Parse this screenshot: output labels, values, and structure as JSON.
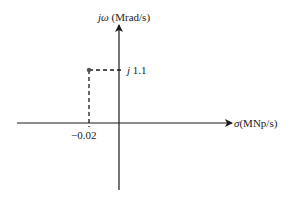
{
  "diagram": {
    "type": "s-plane pole plot",
    "vertical_axis": {
      "symbol": "jω",
      "unit": "(Mrad/s)"
    },
    "horizontal_axis": {
      "symbol": "σ",
      "unit": "(MNp/s)"
    },
    "point": {
      "sigma": -0.02,
      "omega": 1.1
    },
    "tick_labels": {
      "imag": "1.1",
      "imag_prefix": "j",
      "real": "−0.02"
    }
  },
  "colors": {
    "axis": "#1a1a1a",
    "dash": "#1a1a1a",
    "point": "#555555"
  }
}
